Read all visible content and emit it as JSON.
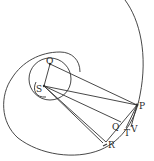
{
  "diagram": {
    "type": "geometric-figure",
    "labels": {
      "O": "O",
      "S": "S",
      "P": "P",
      "Q": "Q",
      "T": "T",
      "V": "V",
      "R": "R"
    },
    "points": {
      "O": [
        50,
        64
      ],
      "S": [
        44,
        86
      ],
      "P": [
        137,
        105
      ],
      "Q": [
        121,
        122
      ],
      "T": [
        128,
        124
      ],
      "V": [
        133,
        123
      ],
      "R": [
        106,
        142
      ]
    },
    "colors": {
      "ink": "#333333",
      "paper": "#ffffff"
    }
  }
}
